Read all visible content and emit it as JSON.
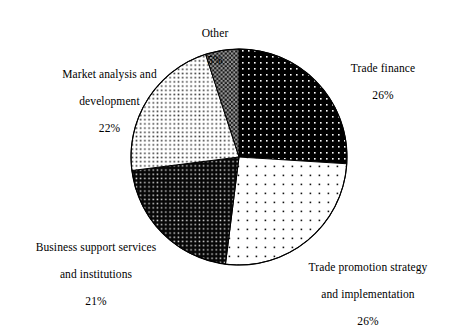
{
  "chart_data": {
    "type": "pie",
    "title": "",
    "subtitle": "",
    "xlabel": "",
    "ylabel": "",
    "legend_position": "none",
    "grid": false,
    "value_unit": "%",
    "start_angle_deg": 0,
    "direction": "clockwise",
    "categories": [
      "Trade finance",
      "Trade promotion strategy and implementation",
      "Business support services and institutions",
      "Market analysis and development",
      "Other"
    ],
    "values": [
      26,
      26,
      21,
      22,
      5
    ],
    "slices": [
      {
        "label": "Trade finance",
        "label_lines": [
          "Trade finance"
        ],
        "value": 26,
        "value_text": "26%",
        "fill_style": "black-with-white-dots",
        "fill_base": "#000000",
        "fill_dot": "#ffffff",
        "start_deg": 0,
        "end_deg": 93.6
      },
      {
        "label": "Trade promotion strategy and implementation",
        "label_lines": [
          "Trade promotion strategy",
          "and implementation"
        ],
        "value": 26,
        "value_text": "26%",
        "fill_style": "white-with-sparse-black-dots",
        "fill_base": "#ffffff",
        "fill_dot": "#000000",
        "start_deg": 93.6,
        "end_deg": 187.2
      },
      {
        "label": "Business support services and institutions",
        "label_lines": [
          "Business support services",
          "and institutions"
        ],
        "value": 21,
        "value_text": "21%",
        "fill_style": "black-with-dense-white-dots",
        "fill_base": "#0a0a0a",
        "fill_dot": "#e8e8e8",
        "start_deg": 187.2,
        "end_deg": 262.8
      },
      {
        "label": "Market analysis and development",
        "label_lines": [
          "Market analysis and",
          "development"
        ],
        "value": 22,
        "value_text": "22%",
        "fill_style": "white-with-dense-black-dots",
        "fill_base": "#ffffff",
        "fill_dot": "#444444",
        "start_deg": 262.8,
        "end_deg": 342.0
      },
      {
        "label": "Other",
        "label_lines": [
          "Other"
        ],
        "value": 5,
        "value_text": "5%",
        "fill_style": "gray-checkered",
        "fill_base": "#888888",
        "fill_dot": "#1a1a1a",
        "start_deg": 342.0,
        "end_deg": 360.0
      }
    ],
    "outline_color": "#000000",
    "background_color": "#ffffff"
  }
}
